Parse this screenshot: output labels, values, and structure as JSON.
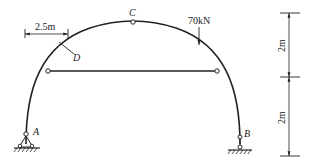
{
  "diagram": {
    "type": "three-hinged arch with tie rod",
    "points": {
      "A": "A",
      "B": "B",
      "C": "C",
      "D": "D"
    },
    "load": {
      "label": "70kN",
      "direction": "down"
    },
    "dimensions": {
      "horizontal_D": "2.5m",
      "vertical_upper": "2m",
      "vertical_lower": "2m"
    },
    "colors": {
      "line": "#222222",
      "background": "#ffffff"
    }
  }
}
